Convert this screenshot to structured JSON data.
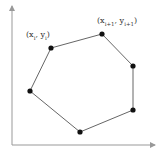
{
  "diagram": {
    "type": "polygon-on-axes",
    "colors": {
      "axis": "#999999",
      "edge": "#666666",
      "vertex": "#111111",
      "background": "#ffffff"
    },
    "axes": {
      "origin": [
        12,
        145
      ],
      "x_end": [
        155,
        145
      ],
      "y_end": [
        12,
        8
      ]
    },
    "vertices": [
      {
        "x": 51,
        "y": 48
      },
      {
        "x": 102,
        "y": 34
      },
      {
        "x": 133,
        "y": 66
      },
      {
        "x": 133,
        "y": 110
      },
      {
        "x": 80,
        "y": 132
      },
      {
        "x": 30,
        "y": 91
      }
    ],
    "labels": [
      {
        "id": "vertex-i",
        "open": "(x",
        "sub1": "i",
        "mid": ", y",
        "sub2": "i",
        "close": ")"
      },
      {
        "id": "vertex-i-plus-1",
        "open": "(x",
        "sub1": "i+1",
        "mid": ", y",
        "sub2": "i+1",
        "close": ")"
      }
    ]
  }
}
